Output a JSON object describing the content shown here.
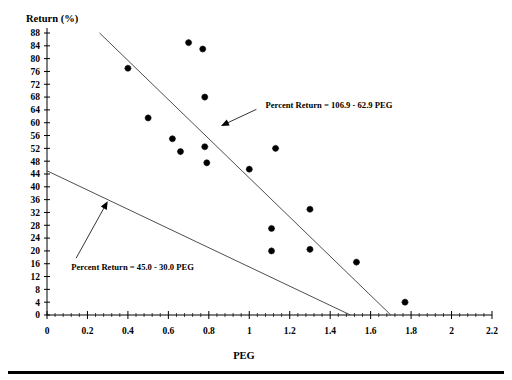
{
  "chart_data": {
    "type": "scatter",
    "title": "",
    "xlabel": "PEG",
    "ylabel": "Return (%)",
    "xlim": [
      0,
      2.2
    ],
    "ylim": [
      0,
      88
    ],
    "xticks": [
      "0",
      "0.2",
      "0.4",
      "0.6",
      "0.8",
      "1",
      "1.2",
      "1.4",
      "1.6",
      "1.8",
      "2",
      "2.2"
    ],
    "xtick_values": [
      0,
      0.2,
      0.4,
      0.6,
      0.8,
      1.0,
      1.2,
      1.4,
      1.6,
      1.8,
      2.0,
      2.2
    ],
    "yticks": [
      "0",
      "4",
      "8",
      "12",
      "16",
      "20",
      "24",
      "28",
      "32",
      "36",
      "40",
      "44",
      "48",
      "52",
      "56",
      "60",
      "64",
      "68",
      "72",
      "76",
      "80",
      "84",
      "88"
    ],
    "ytick_values": [
      0,
      4,
      8,
      12,
      16,
      20,
      24,
      28,
      32,
      36,
      40,
      44,
      48,
      52,
      56,
      60,
      64,
      68,
      72,
      76,
      80,
      84,
      88
    ],
    "grid": false,
    "legend": false,
    "x": [
      0.4,
      0.5,
      0.62,
      0.66,
      0.7,
      0.77,
      0.78,
      0.78,
      0.79,
      1.0,
      1.11,
      1.11,
      1.13,
      1.3,
      1.3,
      1.53,
      1.77
    ],
    "y": [
      77.0,
      61.5,
      55.0,
      51.0,
      85.0,
      83.0,
      68.0,
      52.5,
      47.5,
      45.5,
      27.0,
      20.0,
      52.0,
      33.0,
      20.5,
      16.5,
      4.0
    ],
    "points": [
      {
        "x": 0.4,
        "y": 77.0
      },
      {
        "x": 0.5,
        "y": 61.5
      },
      {
        "x": 0.62,
        "y": 55.0
      },
      {
        "x": 0.66,
        "y": 51.0
      },
      {
        "x": 0.7,
        "y": 85.0
      },
      {
        "x": 0.77,
        "y": 83.0
      },
      {
        "x": 0.78,
        "y": 68.0
      },
      {
        "x": 0.78,
        "y": 52.5
      },
      {
        "x": 0.79,
        "y": 47.5
      },
      {
        "x": 1.0,
        "y": 45.5
      },
      {
        "x": 1.11,
        "y": 27.0
      },
      {
        "x": 1.11,
        "y": 20.0
      },
      {
        "x": 1.13,
        "y": 52.0
      },
      {
        "x": 1.3,
        "y": 33.0
      },
      {
        "x": 1.3,
        "y": 20.5
      },
      {
        "x": 1.53,
        "y": 16.5
      },
      {
        "x": 1.77,
        "y": 4.0
      }
    ],
    "lines": [
      {
        "name": "steep-fit-line",
        "label": "Percent Return = 106.9 - 62.9 PEG",
        "intercept": 106.9,
        "slope": -62.9,
        "x_start": 0.26,
        "x_end": 1.7
      },
      {
        "name": "shallow-fit-line",
        "label": "Percent Return = 45.0 - 30.0 PEG",
        "intercept": 45.0,
        "slope": -30.0,
        "x_start": 0.0,
        "x_end": 1.5
      }
    ],
    "annotations": [
      {
        "name": "steep-line-annotation",
        "text": "Percent Return = 106.9 - 62.9 PEG",
        "text_x": 1.08,
        "text_y": 65.5,
        "arrow_tip_x": 0.86,
        "arrow_tip_y": 59.0
      },
      {
        "name": "shallow-line-annotation",
        "text": "Percent Return = 45.0 - 30.0 PEG",
        "text_x": 0.12,
        "text_y": 15.0,
        "arrow_tip_x": 0.3,
        "arrow_tip_y": 35.5
      }
    ]
  }
}
